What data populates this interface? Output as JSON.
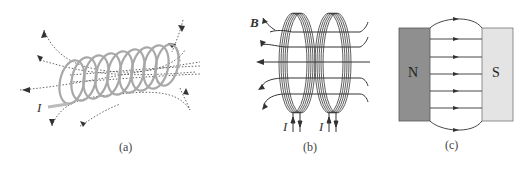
{
  "figure": {
    "panels": [
      {
        "id": "a",
        "caption": "(a)",
        "description": "Solenoid carrying current I with magnetic field lines (dotted)",
        "current_label": "I"
      },
      {
        "id": "b",
        "caption": "(b)",
        "description": "Two coaxial circular coils carrying current I with field lines B",
        "field_label": "B",
        "current_labels": [
          "I",
          "I"
        ]
      },
      {
        "id": "c",
        "caption": "(c)",
        "description": "Uniform magnetic field between N and S magnet poles",
        "north_label": "N",
        "south_label": "S"
      }
    ],
    "colors": {
      "coil_a": "#a8a8a8",
      "lines": "#333333",
      "north_fill": "#8f8f8f",
      "south_fill": "#e4e4e4"
    }
  }
}
